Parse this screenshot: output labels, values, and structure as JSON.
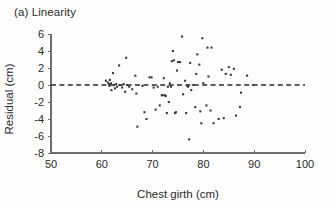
{
  "figure": {
    "panel_label": "(a) Linearity",
    "background_color": "#ffffff",
    "point_color": "#3a3a3a",
    "axis_color": "#6e6e6e",
    "reference_line_color": "#2a2a2a"
  },
  "chart_data": {
    "type": "scatter",
    "title": "(a) Linearity",
    "xlabel": "Chest girth (cm)",
    "ylabel": "Residual (cm)",
    "xlim": [
      50,
      100
    ],
    "ylim": [
      -8,
      6
    ],
    "xticks": [
      50,
      60,
      70,
      80,
      90,
      100
    ],
    "yticks": [
      -8,
      -6,
      -4,
      -2,
      0,
      2,
      4,
      6
    ],
    "xtick_labels": [
      "50",
      "60",
      "70",
      "80",
      "90",
      "100"
    ],
    "ytick_labels": [
      "-8",
      "-6",
      "-4",
      "-2",
      "0",
      "2",
      "4",
      "6"
    ],
    "grid": false,
    "legend": null,
    "annotations": [
      {
        "type": "hline",
        "y": 0,
        "style": "dashed",
        "label": "zero residual reference"
      }
    ],
    "points": [
      {
        "x": 60.8,
        "y": 0.5
      },
      {
        "x": 61.2,
        "y": 0.3
      },
      {
        "x": 61.4,
        "y": 0.1
      },
      {
        "x": 61.5,
        "y": -0.1
      },
      {
        "x": 61.6,
        "y": 0.6
      },
      {
        "x": 61.8,
        "y": 0.2
      },
      {
        "x": 61.9,
        "y": -0.6
      },
      {
        "x": 62.2,
        "y": 1.4
      },
      {
        "x": 62.4,
        "y": 0.0
      },
      {
        "x": 62.6,
        "y": -0.4
      },
      {
        "x": 62.8,
        "y": 0.1
      },
      {
        "x": 63.0,
        "y": -0.2
      },
      {
        "x": 63.4,
        "y": 2.3
      },
      {
        "x": 63.6,
        "y": 0.0
      },
      {
        "x": 64.0,
        "y": -0.3
      },
      {
        "x": 64.3,
        "y": 0.1
      },
      {
        "x": 64.6,
        "y": -0.8
      },
      {
        "x": 64.8,
        "y": 3.2
      },
      {
        "x": 65.0,
        "y": 0.0
      },
      {
        "x": 65.4,
        "y": -0.2
      },
      {
        "x": 66.0,
        "y": -0.5
      },
      {
        "x": 66.6,
        "y": 1.1
      },
      {
        "x": 66.8,
        "y": -1.0
      },
      {
        "x": 67.0,
        "y": -4.9
      },
      {
        "x": 68.0,
        "y": -0.1
      },
      {
        "x": 68.4,
        "y": -3.2
      },
      {
        "x": 68.8,
        "y": -4.0
      },
      {
        "x": 69.4,
        "y": 0.9
      },
      {
        "x": 69.8,
        "y": 0.9
      },
      {
        "x": 70.2,
        "y": -0.3
      },
      {
        "x": 70.6,
        "y": -2.9
      },
      {
        "x": 71.0,
        "y": -0.2
      },
      {
        "x": 71.4,
        "y": -2.4
      },
      {
        "x": 71.8,
        "y": -1.2
      },
      {
        "x": 72.0,
        "y": -1.2
      },
      {
        "x": 72.2,
        "y": 0.8
      },
      {
        "x": 72.4,
        "y": -1.2
      },
      {
        "x": 72.6,
        "y": -1.3
      },
      {
        "x": 72.8,
        "y": -3.3
      },
      {
        "x": 73.0,
        "y": -0.2
      },
      {
        "x": 73.2,
        "y": -2.0
      },
      {
        "x": 73.4,
        "y": 0.2
      },
      {
        "x": 73.6,
        "y": -0.2
      },
      {
        "x": 73.8,
        "y": 2.8
      },
      {
        "x": 74.0,
        "y": 4.0
      },
      {
        "x": 74.2,
        "y": 2.9
      },
      {
        "x": 74.4,
        "y": -3.3
      },
      {
        "x": 74.6,
        "y": -3.2
      },
      {
        "x": 74.8,
        "y": 1.7
      },
      {
        "x": 75.0,
        "y": 2.7
      },
      {
        "x": 75.4,
        "y": 2.7
      },
      {
        "x": 75.8,
        "y": 5.7
      },
      {
        "x": 76.0,
        "y": -1.1
      },
      {
        "x": 76.4,
        "y": 0.5
      },
      {
        "x": 76.6,
        "y": -3.3
      },
      {
        "x": 76.8,
        "y": -0.1
      },
      {
        "x": 77.0,
        "y": -0.2
      },
      {
        "x": 77.2,
        "y": -6.4
      },
      {
        "x": 77.4,
        "y": 2.6
      },
      {
        "x": 77.6,
        "y": -0.6
      },
      {
        "x": 78.0,
        "y": 0.0
      },
      {
        "x": 78.4,
        "y": -2.6
      },
      {
        "x": 78.6,
        "y": 1.3
      },
      {
        "x": 78.8,
        "y": 3.6
      },
      {
        "x": 79.2,
        "y": 2.4
      },
      {
        "x": 79.4,
        "y": -3.1
      },
      {
        "x": 79.6,
        "y": -4.5
      },
      {
        "x": 79.8,
        "y": 5.5
      },
      {
        "x": 80.0,
        "y": 0.2
      },
      {
        "x": 80.6,
        "y": -2.4
      },
      {
        "x": 80.8,
        "y": 4.4
      },
      {
        "x": 81.0,
        "y": 1.0
      },
      {
        "x": 81.4,
        "y": -3.0
      },
      {
        "x": 81.6,
        "y": 4.4
      },
      {
        "x": 82.0,
        "y": -4.5
      },
      {
        "x": 83.0,
        "y": -4.0
      },
      {
        "x": 83.6,
        "y": 1.8
      },
      {
        "x": 84.0,
        "y": -3.9
      },
      {
        "x": 84.4,
        "y": 1.3
      },
      {
        "x": 85.0,
        "y": 2.1
      },
      {
        "x": 85.4,
        "y": 1.2
      },
      {
        "x": 86.0,
        "y": 1.9
      },
      {
        "x": 86.4,
        "y": -3.6
      },
      {
        "x": 87.2,
        "y": -2.6
      },
      {
        "x": 87.4,
        "y": -0.9
      },
      {
        "x": 88.6,
        "y": 1.1
      },
      {
        "x": 89.8,
        "y": 0.0
      }
    ]
  }
}
